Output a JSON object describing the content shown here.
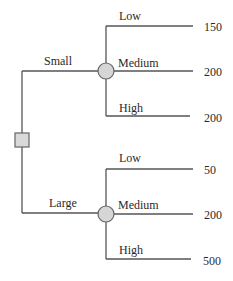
{
  "diagram": {
    "type": "decision-tree",
    "decision_node": {
      "shape": "square"
    },
    "branches": [
      {
        "label": "Small",
        "chance_node": {
          "shape": "circle"
        },
        "outcomes": [
          {
            "label": "Low",
            "value": "150"
          },
          {
            "label": "Medium",
            "value": "200"
          },
          {
            "label": "High",
            "value": "200"
          }
        ]
      },
      {
        "label": "Large",
        "chance_node": {
          "shape": "circle"
        },
        "outcomes": [
          {
            "label": "Low",
            "value": "50"
          },
          {
            "label": "Medium",
            "value": "200"
          },
          {
            "label": "High",
            "value": "500"
          }
        ]
      }
    ],
    "colors": {
      "line": "#555555",
      "node_fill": "#d6d6d6",
      "node_stroke": "#666666"
    }
  }
}
